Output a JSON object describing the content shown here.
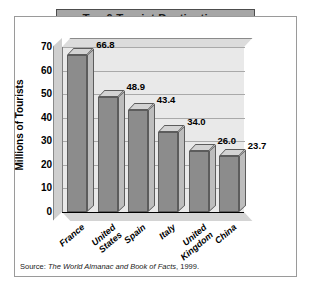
{
  "chart_data": {
    "type": "bar",
    "title": "Top 6 Tourist Destinations",
    "xlabel": "",
    "ylabel": "Millions of Tourists",
    "categories": [
      "France",
      "United States",
      "Spain",
      "Italy",
      "United Kingdom",
      "China"
    ],
    "values": [
      66.8,
      48.9,
      43.4,
      34.0,
      26.0,
      23.7
    ],
    "value_labels": [
      "66.8",
      "48.9",
      "43.4",
      "34.0",
      "26.0",
      "23.7"
    ],
    "ylim": [
      0,
      70
    ],
    "yticks": [
      0,
      10,
      20,
      30,
      40,
      50,
      60,
      70
    ],
    "ytick_labels": [
      "0",
      "10",
      "20",
      "30",
      "40",
      "50",
      "60",
      "70"
    ],
    "grid": true,
    "legend": false,
    "style": "3d-column",
    "colors": {
      "bar_face": "#8c8c8c",
      "bar_top": "#d3d3d3",
      "bar_side": "#bdbdbd",
      "plot_background": "#e9e9e9",
      "gridline": "#a9a9a9",
      "title_banner": "#a6a6a6",
      "frame": "#9a9a9a"
    }
  },
  "source": {
    "prefix": "Source: ",
    "publication": "The World Almanac and Book of Facts",
    "suffix": ", 1999."
  }
}
